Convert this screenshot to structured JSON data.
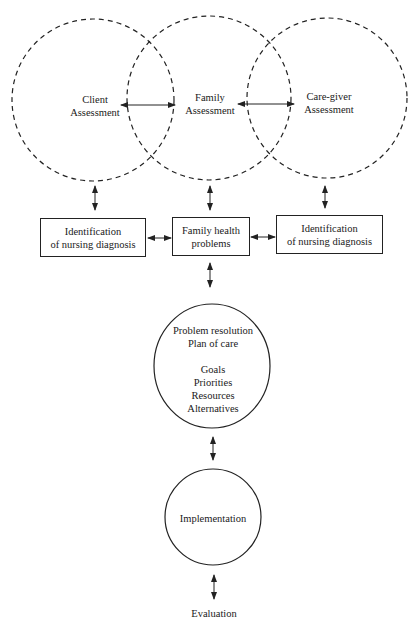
{
  "diagram": {
    "assessments": {
      "client": {
        "line1": "Client",
        "line2": "Assessment"
      },
      "family": {
        "line1": "Family",
        "line2": "Assessment"
      },
      "caregiver": {
        "line1": "Care-giver",
        "line2": "Assessment"
      }
    },
    "boxes": {
      "left": {
        "line1": "Identification",
        "line2": "of nursing diagnosis"
      },
      "center": {
        "line1": "Family health",
        "line2": "problems"
      },
      "right": {
        "line1": "Identification",
        "line2": "of nursing diagnosis"
      }
    },
    "plan_circle": {
      "title1": "Problem resolution",
      "title2": "Plan of care",
      "items": [
        "Goals",
        "Priorities",
        "Resources",
        "Alternatives"
      ]
    },
    "implementation": "Implementation",
    "evaluation": "Evaluation",
    "colors": {
      "stroke": "#222222",
      "background": "#ffffff"
    }
  }
}
